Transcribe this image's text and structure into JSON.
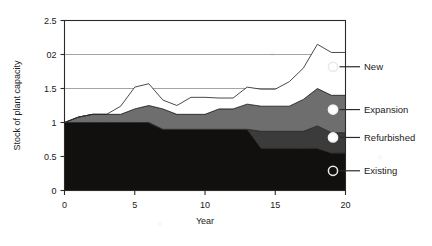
{
  "chart_data": {
    "type": "area",
    "stacked": true,
    "title": "",
    "xlabel": "Year",
    "ylabel": "Stock of plant capacity",
    "xlim": [
      0,
      20
    ],
    "ylim": [
      0,
      2.5
    ],
    "grid": true,
    "grid_axis": "y",
    "legend_position": "right-inline-markers",
    "x_ticks": [
      "0",
      "5",
      "10",
      "15",
      "20"
    ],
    "x_tick_values": [
      0,
      5,
      10,
      15,
      20
    ],
    "y_ticks": [
      "0",
      "0.5",
      "1",
      "1.5",
      "02",
      "2.5"
    ],
    "y_tick_values": [
      0,
      0.5,
      1,
      1.5,
      2,
      2.5
    ],
    "x": [
      0,
      1,
      2,
      3,
      4,
      5,
      6,
      7,
      8,
      9,
      10,
      11,
      12,
      13,
      14,
      15,
      16,
      17,
      18,
      19,
      20
    ],
    "series": [
      {
        "name": "Existing",
        "color": "#120f0f",
        "values": [
          1.0,
          1.0,
          1.0,
          1.0,
          1.0,
          1.0,
          1.0,
          0.9,
          0.9,
          0.9,
          0.9,
          0.9,
          0.9,
          0.9,
          0.62,
          0.62,
          0.62,
          0.62,
          0.62,
          0.55,
          0.55
        ]
      },
      {
        "name": "Refurbished",
        "color": "#3b3b3b",
        "values": [
          0.0,
          0.0,
          0.0,
          0.0,
          0.0,
          0.0,
          0.0,
          0.0,
          0.0,
          0.0,
          0.0,
          0.0,
          0.0,
          0.0,
          0.25,
          0.25,
          0.25,
          0.25,
          0.33,
          0.3,
          0.3
        ]
      },
      {
        "name": "Expansion",
        "color": "#6e6e6e",
        "values": [
          0.0,
          0.08,
          0.12,
          0.12,
          0.12,
          0.2,
          0.25,
          0.3,
          0.22,
          0.22,
          0.22,
          0.3,
          0.3,
          0.37,
          0.37,
          0.37,
          0.37,
          0.47,
          0.55,
          0.55,
          0.55
        ]
      },
      {
        "name": "New",
        "color": "#ffffff",
        "values": [
          0.0,
          0.0,
          0.0,
          0.0,
          0.12,
          0.32,
          0.32,
          0.13,
          0.13,
          0.25,
          0.25,
          0.16,
          0.16,
          0.25,
          0.25,
          0.25,
          0.36,
          0.46,
          0.65,
          0.63,
          0.63
        ]
      }
    ],
    "totals": [
      1.0,
      1.08,
      1.12,
      1.12,
      1.24,
      1.52,
      1.57,
      1.33,
      1.25,
      1.37,
      1.37,
      1.36,
      1.36,
      1.52,
      1.49,
      1.49,
      1.6,
      1.8,
      2.15,
      2.03,
      2.03
    ],
    "legend_entries": [
      {
        "label": "New",
        "marker": "open-circle",
        "y_value": 1.82
      },
      {
        "label": "Expansion",
        "marker": "filled-circle",
        "y_value": 1.19
      },
      {
        "label": "Refurbished",
        "marker": "filled-circle",
        "y_value": 0.78
      },
      {
        "label": "Existing",
        "marker": "open-circle",
        "y_value": 0.29
      }
    ]
  },
  "colors": {
    "existing": "#120f0f",
    "refurbished": "#3b3b3b",
    "expansion": "#6e6e6e",
    "new": "#ffffff",
    "axis": "#2a2a2a",
    "grid": "#9a9a9a",
    "background": "#ffffff"
  }
}
